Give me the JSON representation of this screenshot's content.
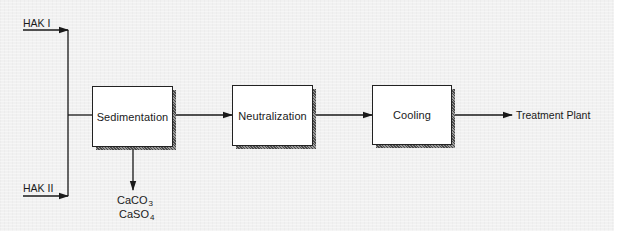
{
  "diagram": {
    "type": "process-flow",
    "inputs": [
      {
        "id": "hak1",
        "label": "HAK I"
      },
      {
        "id": "hak2",
        "label": "HAK II"
      }
    ],
    "steps": [
      {
        "id": "sedimentation",
        "label": "Sedimentation"
      },
      {
        "id": "neutralization",
        "label": "Neutralization"
      },
      {
        "id": "cooling",
        "label": "Cooling"
      }
    ],
    "output": {
      "label": "Treatment Plant"
    },
    "byproducts": [
      {
        "base": "CaCO",
        "subscript": "3"
      },
      {
        "base": "CaSO",
        "subscript": "4"
      }
    ],
    "edges": [
      {
        "from": "HAK I",
        "to": "Sedimentation"
      },
      {
        "from": "HAK II",
        "to": "Sedimentation"
      },
      {
        "from": "Sedimentation",
        "to": "Neutralization"
      },
      {
        "from": "Neutralization",
        "to": "Cooling"
      },
      {
        "from": "Cooling",
        "to": "Treatment Plant"
      },
      {
        "from": "Sedimentation",
        "to": "CaCO3 / CaSO4"
      }
    ]
  },
  "colors": {
    "background": "#f1f1f1",
    "line": "#1a1a1a",
    "box_fill": "#ffffff"
  }
}
